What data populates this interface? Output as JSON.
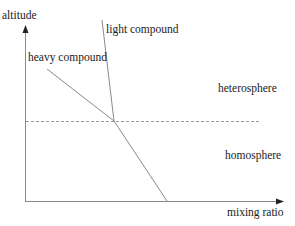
{
  "diagram": {
    "axes": {
      "y_label": "altitude",
      "x_label": "mixing ratio"
    },
    "curves": {
      "light_label": "light compound",
      "heavy_label": "heavy compound"
    },
    "regions": {
      "upper_label": "heterosphere",
      "lower_label": "homosphere"
    },
    "colors": {
      "line": "#8a8a8a",
      "axis": "#8a8a8a",
      "dashed": "#9a9a9a",
      "text": "#1a1a1a"
    }
  }
}
